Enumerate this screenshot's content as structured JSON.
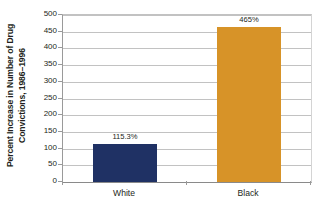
{
  "chart_data": {
    "type": "bar",
    "title": "",
    "categories": [
      "White",
      "Black"
    ],
    "values": [
      115.3,
      465
    ],
    "value_labels": [
      "115.3%",
      "465%"
    ],
    "series": [
      {
        "name": "Percent Increase in Number of Drug Convictions, 1986-1996",
        "values": [
          115.3,
          465
        ]
      }
    ],
    "xlabel": "",
    "ylabel": "Percent Increase in Number of Drug Convictions, 1986–1996",
    "ylabel_line1": "Percent Increase in Number of Drug",
    "ylabel_line2": "Convictions, 1986–1996",
    "ylim": [
      0,
      500
    ],
    "ytick_step": 50,
    "yticks": [
      "500",
      "450",
      "400",
      "350",
      "300",
      "250",
      "200",
      "150",
      "100",
      "50",
      "0"
    ],
    "ytick_values": [
      500,
      450,
      400,
      350,
      300,
      250,
      200,
      150,
      100,
      50,
      0
    ],
    "grid": true,
    "grid_axis": "y",
    "legend": false,
    "legend_position": "none",
    "bar_colors": [
      "#1f3164",
      "#d79328"
    ],
    "colors": {
      "bar_white": "#1f3164",
      "bar_black": "#d79328",
      "gridline": "#c2c2c2",
      "axis": "#9a9a9a",
      "text": "#231f20",
      "background": "#ffffff"
    }
  }
}
